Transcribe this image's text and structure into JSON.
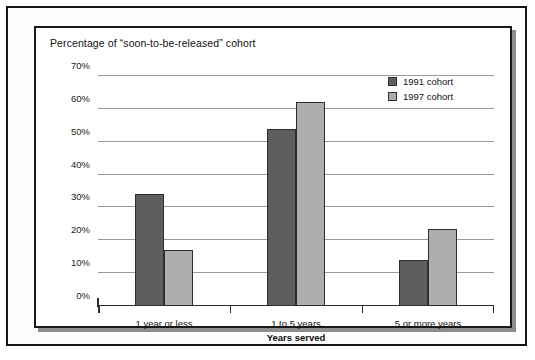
{
  "chart_data": {
    "type": "bar",
    "title": "Percentage of “soon-to-be-released” cohort",
    "xlabel": "Years served",
    "ylabel": "",
    "categories": [
      "1 year or less",
      "1 to 5 years",
      "5 or more years"
    ],
    "series": [
      {
        "name": "1991 cohort",
        "color": "#5e5e5e",
        "values": [
          34,
          54,
          14
        ]
      },
      {
        "name": "1997 cohort",
        "color": "#aeaeae",
        "values": [
          17,
          62,
          23.5
        ]
      }
    ],
    "ylim": [
      0,
      70
    ],
    "ytick_values": [
      0,
      10,
      20,
      30,
      40,
      50,
      60,
      70
    ],
    "ytick_labels": [
      "0%",
      "10%",
      "20%",
      "30%",
      "40%",
      "50%",
      "60%",
      "70%"
    ],
    "grid": true,
    "legend_position": "top-right"
  }
}
